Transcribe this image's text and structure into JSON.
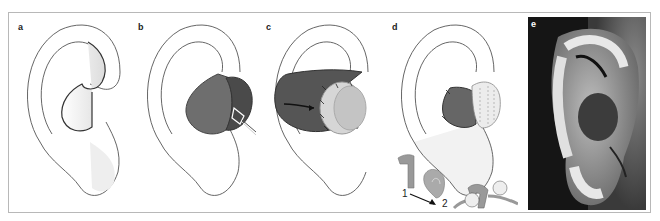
{
  "figure": {
    "panels": [
      {
        "id": "a",
        "label": "a",
        "description": "Outline of ear showing defect in concha"
      },
      {
        "id": "b",
        "label": "b",
        "description": "Ear with dark flap elevated, retracted with hook"
      },
      {
        "id": "c",
        "label": "c",
        "description": "Flap rotated with arrow indicating direction, sutured"
      },
      {
        "id": "d",
        "label": "d",
        "description": "Reconstructed ear with cartilage grafts; inset diagrams 1 and 2"
      },
      {
        "id": "e",
        "label": "e",
        "description": "Clinical photograph of reconstructed ear"
      }
    ],
    "inset_numbers": [
      "1",
      "2"
    ],
    "colors": {
      "frame": "#b8b8b8",
      "outline": "#555555",
      "flap_dark": "#555555",
      "flap_mid": "#7a7a7a",
      "graft_light": "#d8d8d8",
      "shading": "#e6e6e6",
      "photo_bg": "#1a1a1a"
    }
  }
}
